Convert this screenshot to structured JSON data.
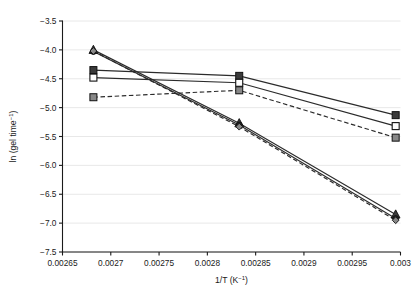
{
  "chart_data": {
    "type": "line",
    "title": "",
    "subtitle": "",
    "xlabel": "1/T (K⁻¹)",
    "ylabel": "ln (gel time⁻¹)",
    "xlim": [
      0.00265,
      0.003
    ],
    "ylim": [
      -7.5,
      -3.5
    ],
    "xticks": [
      0.00265,
      0.0027,
      0.00275,
      0.0028,
      0.00285,
      0.0029,
      0.00295,
      0.003
    ],
    "xticklabels": [
      "0.00265",
      "0.0027",
      "0.00275",
      "0.0028",
      "0.00285",
      "0.0029",
      "0.00295",
      "0.003"
    ],
    "yticks": [
      -3.5,
      -4.0,
      -4.5,
      -5.0,
      -5.5,
      -6.0,
      -6.5,
      -7.0,
      -7.5
    ],
    "yticklabels": [
      "−3.5",
      "−4.0",
      "−4.5",
      "−5.0",
      "−5.5",
      "−6.0",
      "−6.5",
      "−7.0",
      "−7.5"
    ],
    "grid": true,
    "grid_axis": "y",
    "legend": false,
    "legend_position": "none",
    "x": [
      0.002682,
      0.002833,
      0.002995
    ],
    "series": [
      {
        "name": "series-1-filled-square-solid",
        "marker": "filled-square",
        "linestyle": "solid",
        "color": "#2b2b2b",
        "values": [
          -4.35,
          -4.45,
          -5.13
        ]
      },
      {
        "name": "series-2-open-square-solid",
        "marker": "open-square",
        "linestyle": "solid",
        "color": "#2b2b2b",
        "values": [
          -4.48,
          -4.57,
          -5.32
        ]
      },
      {
        "name": "series-3-gray-square-dashed",
        "marker": "gray-square",
        "linestyle": "dashed",
        "color": "#2b2b2b",
        "values": [
          -4.82,
          -4.7,
          -5.52
        ]
      },
      {
        "name": "series-4-triangle-solid",
        "marker": "filled-triangle",
        "linestyle": "solid",
        "color": "#2b2b2b",
        "values": [
          -4.0,
          -5.27,
          -6.85
        ]
      },
      {
        "name": "series-5-circle-solid",
        "marker": "filled-circle",
        "linestyle": "solid",
        "color": "#2b2b2b",
        "values": [
          -4.03,
          -5.3,
          -6.92
        ]
      },
      {
        "name": "series-6-diamond-dashed",
        "marker": "gray-diamond",
        "linestyle": "dashed",
        "color": "#2b2b2b",
        "values": [
          -4.02,
          -5.33,
          -6.95
        ]
      }
    ],
    "colors": {
      "axis": "#1a1a1a",
      "grid": "#e2e2e2",
      "line": "#2b2b2b",
      "marker_fill_dark": "#3a3a3a",
      "marker_fill_gray": "#888888",
      "marker_fill_white": "#ffffff",
      "background": "#ffffff"
    }
  }
}
